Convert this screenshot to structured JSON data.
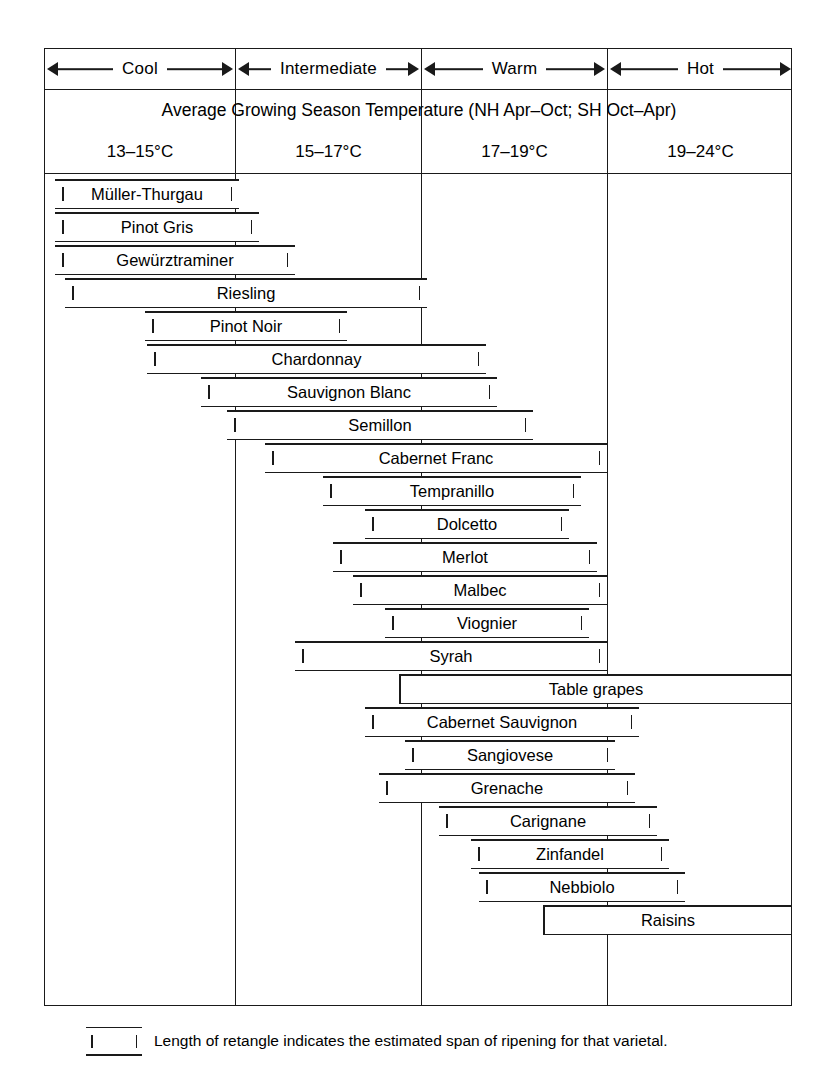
{
  "chart_data": {
    "type": "bar",
    "title": "Average Growing Season Temperature (NH Apr–Oct; SH Oct–Apr)",
    "orientation": "horizontal-range",
    "xlabel": "Average Growing Season Temperature (°C)",
    "ylabel": "",
    "xlim": [
      13,
      24
    ],
    "grid": false,
    "legend_position": "below-chart",
    "zones": [
      {
        "name": "Cool",
        "temp_range": "13–15°C",
        "min": 13,
        "max": 15
      },
      {
        "name": "Intermediate",
        "temp_range": "15–17°C",
        "min": 15,
        "max": 17
      },
      {
        "name": "Warm",
        "temp_range": "17–19°C",
        "min": 17,
        "max": 19
      },
      {
        "name": "Hot",
        "temp_range": "19–24°C",
        "min": 19,
        "max": 24
      }
    ],
    "categories": [
      "Müller-Thurgau",
      "Pinot Gris",
      "Gewürztraminer",
      "Riesling",
      "Pinot Noir",
      "Chardonnay",
      "Sauvignon Blanc",
      "Semillon",
      "Cabernet Franc",
      "Tempranillo",
      "Dolcetto",
      "Merlot",
      "Malbec",
      "Viognier",
      "Syrah",
      "Table grapes",
      "Cabernet Sauvignon",
      "Sangiovese",
      "Grenache",
      "Carignane",
      "Zinfandel",
      "Nebbiolo",
      "Raisins"
    ],
    "series": [
      {
        "name": "Estimated span of ripening",
        "values": [
          [
            13.1,
            15.9
          ],
          [
            13.1,
            16.2
          ],
          [
            13.1,
            16.8
          ],
          [
            13.3,
            18.8
          ],
          [
            14.5,
            17.4
          ],
          [
            14.5,
            19.4
          ],
          [
            15.3,
            20.0
          ],
          [
            15.7,
            20.6
          ],
          [
            16.2,
            21.6
          ],
          [
            17.0,
            21.3
          ],
          [
            17.6,
            20.8
          ],
          [
            17.2,
            21.2
          ],
          [
            17.5,
            21.6
          ],
          [
            17.9,
            21.0
          ],
          [
            16.6,
            21.8
          ],
          [
            18.1,
            24.0
          ],
          [
            17.6,
            22.3
          ],
          [
            18.2,
            21.9
          ],
          [
            17.8,
            22.2
          ],
          [
            18.6,
            22.7
          ],
          [
            19.0,
            22.9
          ],
          [
            19.1,
            23.1
          ],
          [
            19.9,
            24.0
          ]
        ]
      }
    ],
    "annotation": "Length of retangle indicates the estimated span of ripening for that varietal."
  },
  "header": {
    "zones": [
      {
        "label": "Cool",
        "left": 0,
        "width": 190
      },
      {
        "label": "Intermediate",
        "left": 191,
        "width": 185
      },
      {
        "label": "Warm",
        "left": 377,
        "width": 185
      },
      {
        "label": "Hot",
        "left": 563,
        "width": 185
      }
    ],
    "temperature_title": "Average Growing Season Temperature (NH Apr–Oct; SH Oct–Apr)",
    "temperatures": [
      {
        "label": "13–15°C",
        "left": 0,
        "width": 190
      },
      {
        "label": "15–17°C",
        "left": 191,
        "width": 185
      },
      {
        "label": "17–19°C",
        "left": 377,
        "width": 185
      },
      {
        "label": "19–24°C",
        "left": 563,
        "width": 185
      }
    ]
  },
  "dividers": [
    190,
    376,
    562
  ],
  "bars": [
    {
      "label": "Müller-Thurgau",
      "left": 10,
      "width": 184,
      "top": 130,
      "left_open": true,
      "right_open": true
    },
    {
      "label": "Pinot Gris",
      "left": 10,
      "width": 204,
      "top": 163,
      "left_open": true,
      "right_open": true
    },
    {
      "label": "Gewürztraminer",
      "left": 10,
      "width": 240,
      "top": 196,
      "left_open": true,
      "right_open": true
    },
    {
      "label": "Riesling",
      "left": 20,
      "width": 362,
      "top": 229,
      "left_open": true,
      "right_open": true
    },
    {
      "label": "Pinot Noir",
      "left": 100,
      "width": 202,
      "top": 262,
      "left_open": true,
      "right_open": true
    },
    {
      "label": "Chardonnay",
      "left": 102,
      "width": 339,
      "top": 295,
      "left_open": true,
      "right_open": true
    },
    {
      "label": "Sauvignon Blanc",
      "left": 156,
      "width": 296,
      "top": 328,
      "left_open": true,
      "right_open": true
    },
    {
      "label": "Semillon",
      "left": 182,
      "width": 306,
      "top": 361,
      "left_open": true,
      "right_open": true
    },
    {
      "label": "Cabernet Franc",
      "left": 220,
      "width": 342,
      "top": 394,
      "left_open": true,
      "right_open": true
    },
    {
      "label": "Tempranillo",
      "left": 278,
      "width": 258,
      "top": 427,
      "left_open": true,
      "right_open": true
    },
    {
      "label": "Dolcetto",
      "left": 320,
      "width": 204,
      "top": 460,
      "left_open": true,
      "right_open": true
    },
    {
      "label": "Merlot",
      "left": 288,
      "width": 264,
      "top": 493,
      "left_open": true,
      "right_open": true
    },
    {
      "label": "Malbec",
      "left": 308,
      "width": 254,
      "top": 526,
      "left_open": true,
      "right_open": true
    },
    {
      "label": "Viognier",
      "left": 340,
      "width": 204,
      "top": 559,
      "left_open": true,
      "right_open": true
    },
    {
      "label": "Syrah",
      "left": 250,
      "width": 312,
      "top": 592,
      "left_open": true,
      "right_open": true
    },
    {
      "label": "Table grapes",
      "left": 354,
      "width": 394,
      "top": 625,
      "left_open": false,
      "right_open": false
    },
    {
      "label": "Cabernet Sauvignon",
      "left": 320,
      "width": 274,
      "top": 658,
      "left_open": true,
      "right_open": true
    },
    {
      "label": "Sangiovese",
      "left": 360,
      "width": 210,
      "top": 691,
      "left_open": true,
      "right_open": true
    },
    {
      "label": "Grenache",
      "left": 334,
      "width": 256,
      "top": 724,
      "left_open": true,
      "right_open": true
    },
    {
      "label": "Carignane",
      "left": 394,
      "width": 218,
      "top": 757,
      "left_open": true,
      "right_open": true
    },
    {
      "label": "Zinfandel",
      "left": 426,
      "width": 198,
      "top": 790,
      "left_open": true,
      "right_open": true
    },
    {
      "label": "Nebbiolo",
      "left": 434,
      "width": 206,
      "top": 823,
      "left_open": true,
      "right_open": true
    },
    {
      "label": "Raisins",
      "left": 498,
      "width": 250,
      "top": 856,
      "left_open": false,
      "right_open": false
    }
  ],
  "legend": {
    "text": "Length of retangle indicates the estimated span of ripening for that varietal."
  },
  "colors": {
    "ink": "#1a1a1a",
    "paper": "#ffffff"
  }
}
